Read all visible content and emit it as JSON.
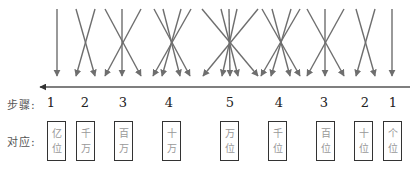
{
  "diagram": {
    "title": "",
    "arrow_color": "#6e6e6e",
    "axis_color": "#555555",
    "main_arrow": {
      "direction": "left",
      "y": 87,
      "x_start": 410,
      "x_end": 40
    },
    "groups": [
      {
        "count": 1,
        "tops": [
          57
        ],
        "bottoms": [
          57
        ]
      },
      {
        "count": 2,
        "tops": [
          76,
          95
        ],
        "bottoms": [
          95,
          76
        ]
      },
      {
        "count": 3,
        "tops": [
          105,
          122,
          141
        ],
        "bottoms": [
          141,
          122,
          105
        ]
      },
      {
        "count": 4,
        "tops": [
          154,
          163,
          181,
          191
        ],
        "bottoms": [
          190,
          180,
          162,
          153
        ]
      },
      {
        "count": 5,
        "tops": [
          202,
          221,
          229,
          237,
          258
        ],
        "bottoms": [
          258,
          238,
          230,
          222,
          203
        ]
      },
      {
        "count": 4,
        "tops": [
          262,
          272,
          291,
          300
        ],
        "bottoms": [
          300,
          290,
          271,
          261
        ]
      },
      {
        "count": 3,
        "tops": [
          307,
          325,
          344
        ],
        "bottoms": [
          344,
          325,
          307
        ]
      },
      {
        "count": 2,
        "tops": [
          356,
          375
        ],
        "bottoms": [
          375,
          356
        ]
      },
      {
        "count": 1,
        "tops": [
          392
        ],
        "bottoms": [
          392
        ]
      }
    ]
  },
  "labels": {
    "steps_label": "步骤:",
    "corresponds_label": "对应:"
  },
  "steps": [
    {
      "value": "1",
      "x": 51
    },
    {
      "value": "2",
      "x": 85
    },
    {
      "value": "3",
      "x": 123
    },
    {
      "value": "4",
      "x": 169
    },
    {
      "value": "5",
      "x": 230
    },
    {
      "value": "4",
      "x": 279
    },
    {
      "value": "3",
      "x": 324
    },
    {
      "value": "2",
      "x": 365
    },
    {
      "value": "1",
      "x": 393
    }
  ],
  "places": [
    {
      "top": "亿",
      "bottom": "位",
      "x": 47
    },
    {
      "top": "千",
      "bottom": "万",
      "x": 76
    },
    {
      "top": "百",
      "bottom": "万",
      "x": 114
    },
    {
      "top": "十",
      "bottom": "万",
      "x": 162
    },
    {
      "top": "万",
      "bottom": "位",
      "x": 220
    },
    {
      "top": "千",
      "bottom": "位",
      "x": 268
    },
    {
      "top": "百",
      "bottom": "位",
      "x": 316
    },
    {
      "top": "十",
      "bottom": "位",
      "x": 354
    },
    {
      "top": "个",
      "bottom": "位",
      "x": 383
    }
  ]
}
